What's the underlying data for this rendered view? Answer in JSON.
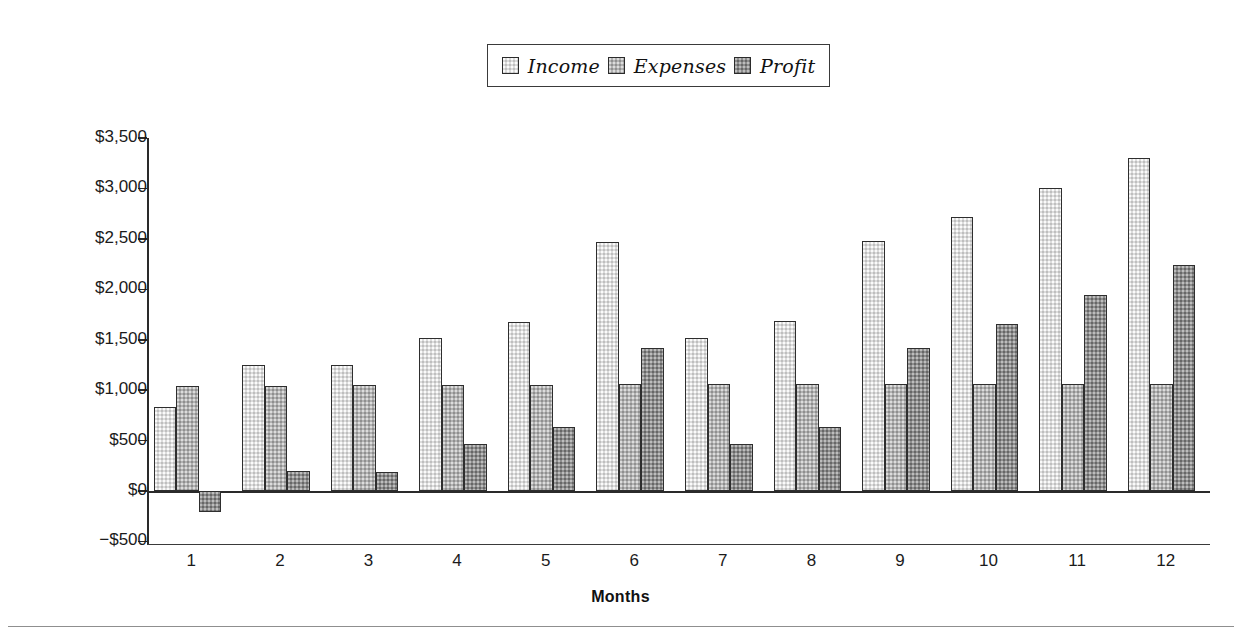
{
  "legend": {
    "position": "top-center",
    "entries": [
      {
        "label": "Income",
        "color": "#dcdcdc",
        "swatch": "income-swatch"
      },
      {
        "label": "Expenses",
        "color": "#b2b2b2",
        "swatch": "expenses-swatch"
      },
      {
        "label": "Profit",
        "color": "#8e8e8e",
        "swatch": "profit-swatch"
      }
    ]
  },
  "axes": {
    "x_title": "Months",
    "y_tick_labels": [
      "$3,500",
      "$3,000",
      "$2,500",
      "$2,000",
      "$1,500",
      "$1,000",
      "$500",
      "$0",
      "−$500"
    ],
    "x_tick_labels": [
      "1",
      "2",
      "3",
      "4",
      "5",
      "6",
      "7",
      "8",
      "9",
      "10",
      "11",
      "12"
    ]
  },
  "chart_data": {
    "type": "bar",
    "title": "",
    "subtitle": "",
    "xlabel": "Months",
    "ylabel": "",
    "ylim": [
      -500,
      3500
    ],
    "ytick_values": [
      3500,
      3000,
      2500,
      2000,
      1500,
      1000,
      500,
      0,
      -500
    ],
    "ytick_labels": [
      "$3,500",
      "$3,000",
      "$2,500",
      "$2,000",
      "$1,500",
      "$1,000",
      "$500",
      "$0",
      "−$500"
    ],
    "grid": false,
    "legend_position": "top-center",
    "categories": [
      "1",
      "2",
      "3",
      "4",
      "5",
      "6",
      "7",
      "8",
      "9",
      "10",
      "11",
      "12"
    ],
    "series": [
      {
        "name": "Income",
        "color": "#dcdcdc",
        "values": [
          835,
          1245,
          1245,
          1515,
          1680,
          2470,
          1520,
          1685,
          2475,
          2720,
          3000,
          3300
        ]
      },
      {
        "name": "Expenses",
        "color": "#b2b2b2",
        "values": [
          1045,
          1045,
          1050,
          1050,
          1055,
          1060,
          1060,
          1060,
          1060,
          1065,
          1065,
          1065
        ]
      },
      {
        "name": "Profit",
        "color": "#8e8e8e",
        "values": [
          -210,
          195,
          190,
          465,
          630,
          1415,
          465,
          635,
          1415,
          1660,
          1945,
          2240
        ]
      }
    ]
  }
}
